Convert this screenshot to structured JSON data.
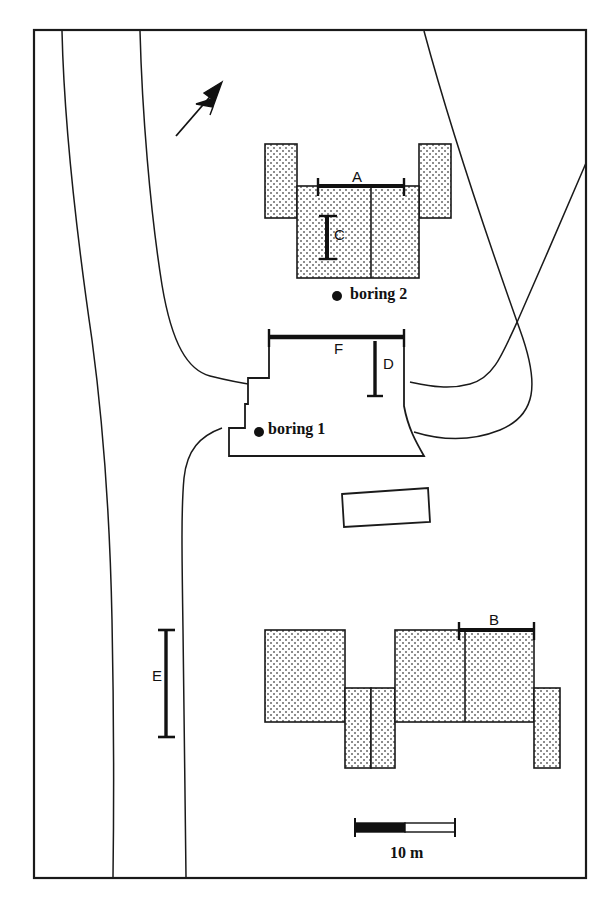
{
  "figure": {
    "type": "site-plan-map",
    "background": "#ffffff",
    "line_color": "#1a1a1a",
    "fill_pattern": "stipple-dots",
    "frame": {
      "x": 34,
      "y": 30,
      "width": 552,
      "height": 848
    }
  },
  "labels": {
    "A": "A",
    "B": "B",
    "C": "C",
    "D": "D",
    "E": "E",
    "F": "F"
  },
  "borings": [
    {
      "id": "boring-1",
      "label": "boring 1",
      "dot_x": 259,
      "dot_y": 432
    },
    {
      "id": "boring-2",
      "label": "boring 2",
      "dot_x": 337,
      "dot_y": 296
    }
  ],
  "scale_bar": {
    "label": "10 m",
    "x": 355,
    "y": 827,
    "length": 100,
    "filled_fraction": 0.5
  },
  "north_arrow": {
    "name": "north-arrow",
    "tail_x": 176,
    "tail_y": 136,
    "head_x": 221,
    "head_y": 84
  },
  "dimension_bars": [
    {
      "id": "A",
      "orientation": "horizontal",
      "x1": 318,
      "y1": 186,
      "x2": 404,
      "y2": 186
    },
    {
      "id": "B",
      "orientation": "horizontal",
      "x1": 459,
      "y1": 630,
      "x2": 534,
      "y2": 630
    },
    {
      "id": "C",
      "orientation": "vertical",
      "x1": 327,
      "y1": 216,
      "x2": 327,
      "y2": 259
    },
    {
      "id": "D",
      "orientation": "vertical",
      "x1": 375,
      "y1": 341,
      "x2": 375,
      "y2": 396
    },
    {
      "id": "E",
      "orientation": "vertical",
      "x1": 166,
      "y1": 630,
      "x2": 166,
      "y2": 737
    },
    {
      "id": "F",
      "orientation": "horizontal",
      "x1": 269,
      "y1": 337,
      "x2": 404,
      "y2": 337
    }
  ],
  "buildings": [
    {
      "id": "building-north",
      "name": "north-building-complex",
      "fill": "stipple"
    },
    {
      "id": "building-center",
      "name": "center-building-boring1",
      "fill": "none"
    },
    {
      "id": "building-small",
      "name": "small-outbuilding",
      "fill": "none"
    },
    {
      "id": "building-south",
      "name": "south-building-complex",
      "fill": "stipple"
    }
  ],
  "roads": [
    {
      "id": "road-west-outer",
      "name": "west-road-outer-edge"
    },
    {
      "id": "road-west-inner",
      "name": "west-road-inner-edge"
    },
    {
      "id": "road-loop-outer",
      "name": "east-road-loop-outer-edge"
    },
    {
      "id": "road-loop-inner",
      "name": "east-road-loop-inner-edge"
    }
  ]
}
